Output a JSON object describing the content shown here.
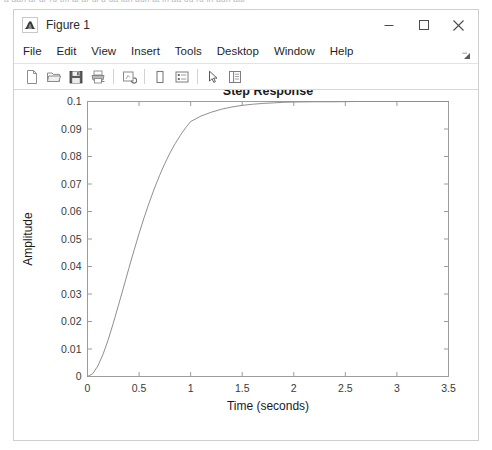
{
  "page": {
    "top_sliver_text": "a aan ar ar ru tm ai ar ui a ua ian aun at in aa ou ru in aun aar"
  },
  "window": {
    "title": "Figure 1",
    "icon": "matlab-figure-icon",
    "controls": {
      "minimize": "minimize-icon",
      "maximize": "maximize-icon",
      "close": "close-icon"
    }
  },
  "menu": {
    "items": [
      {
        "label": "File"
      },
      {
        "label": "Edit"
      },
      {
        "label": "View"
      },
      {
        "label": "Insert"
      },
      {
        "label": "Tools"
      },
      {
        "label": "Desktop"
      },
      {
        "label": "Window"
      },
      {
        "label": "Help"
      }
    ],
    "overflow_icon": "menu-overflow-arrow-icon"
  },
  "toolbar": {
    "buttons": [
      {
        "name": "new-figure-button",
        "icon": "new-document-icon"
      },
      {
        "name": "open-file-button",
        "icon": "open-folder-icon"
      },
      {
        "name": "save-figure-button",
        "icon": "save-floppy-icon"
      },
      {
        "name": "print-figure-button",
        "icon": "printer-icon"
      },
      {
        "name": "link-plot-button",
        "icon": "link-plot-icon"
      },
      {
        "name": "insert-colorbar-button",
        "icon": "colorbar-icon"
      },
      {
        "name": "insert-legend-button",
        "icon": "legend-icon"
      },
      {
        "name": "edit-plot-button",
        "icon": "pointer-arrow-icon"
      },
      {
        "name": "show-plot-tools-button",
        "icon": "plot-tools-icon"
      }
    ]
  },
  "chart_data": {
    "type": "line",
    "title": "Step Response",
    "xlabel": "Time (seconds)",
    "ylabel": "Amplitude",
    "xlim": [
      0,
      3.5
    ],
    "ylim": [
      0,
      0.1
    ],
    "grid": false,
    "legend": null,
    "xticks": [
      0,
      0.5,
      1,
      1.5,
      2,
      2.5,
      3,
      3.5
    ],
    "xticklabels": [
      "0",
      "0.5",
      "1",
      "1.5",
      "2",
      "2.5",
      "3",
      "3.5"
    ],
    "yticks": [
      0,
      0.01,
      0.02,
      0.03,
      0.04,
      0.05,
      0.06,
      0.07,
      0.08,
      0.09,
      0.1
    ],
    "yticklabels": [
      "0",
      "0.01",
      "0.02",
      "0.03",
      "0.04",
      "0.05",
      "0.06",
      "0.07",
      "0.08",
      "0.09",
      "0.1"
    ],
    "line_color": "#8f8f8f",
    "series": [
      {
        "name": "step-response",
        "steady_state": 0.1,
        "x": [
          0,
          0.05,
          0.1,
          0.15,
          0.2,
          0.25,
          0.3,
          0.35,
          0.4,
          0.45,
          0.5,
          0.55,
          0.6,
          0.65,
          0.7,
          0.75,
          0.8,
          0.85,
          0.9,
          0.95,
          1.0,
          1.1,
          1.2,
          1.3,
          1.4,
          1.5,
          1.6,
          1.7,
          1.8,
          1.9,
          2.0,
          2.2,
          2.4,
          2.6,
          2.8,
          3.0,
          3.2,
          3.5
        ],
        "y": [
          0.0,
          0.001,
          0.0038,
          0.008,
          0.0133,
          0.0194,
          0.0259,
          0.0325,
          0.0392,
          0.0457,
          0.052,
          0.0579,
          0.0634,
          0.0685,
          0.0732,
          0.0775,
          0.0813,
          0.0847,
          0.0877,
          0.0904,
          0.0927,
          0.0947,
          0.0961,
          0.0972,
          0.098,
          0.0986,
          0.099,
          0.0993,
          0.0995,
          0.0997,
          0.0998,
          0.0999,
          0.0999,
          0.1,
          0.1,
          0.1,
          0.1,
          0.1
        ]
      }
    ]
  }
}
